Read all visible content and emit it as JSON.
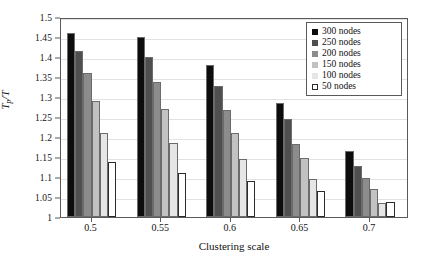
{
  "chart_data": {
    "type": "bar",
    "title": "",
    "subtitle": "",
    "xlabel": "Clustering scale",
    "ylabel": "Tp/T",
    "ylabel_parts": {
      "main": "T",
      "sub": "p",
      "tail": "/T"
    },
    "categories": [
      "0.5",
      "0.55",
      "0.6",
      "0.65",
      "0.7"
    ],
    "ylim": [
      1,
      1.5
    ],
    "ytick_labels": [
      "1",
      "1.05",
      "1.1",
      "1.15",
      "1.2",
      "1.25",
      "1.3",
      "1.35",
      "1.4",
      "1.45",
      "1.5"
    ],
    "ytick_values": [
      1,
      1.05,
      1.1,
      1.15,
      1.2,
      1.25,
      1.3,
      1.35,
      1.4,
      1.45,
      1.5
    ],
    "grid": true,
    "grid_axis": "y",
    "legend_position": "top-right",
    "series": [
      {
        "name": "300 nodes",
        "color": "#0d0d0d",
        "values": [
          1.46,
          1.45,
          1.381,
          1.285,
          1.165
        ]
      },
      {
        "name": "250 nodes",
        "color": "#4f4f4f",
        "values": [
          1.416,
          1.399,
          1.327,
          1.245,
          1.127
        ]
      },
      {
        "name": "200 nodes",
        "color": "#8c8c8c",
        "values": [
          1.361,
          1.338,
          1.268,
          1.183,
          1.097
        ]
      },
      {
        "name": "150 nodes",
        "color": "#c2c2c2",
        "values": [
          1.291,
          1.271,
          1.211,
          1.147,
          1.07
        ]
      },
      {
        "name": "100 nodes",
        "color": "#e6e6e6",
        "values": [
          1.21,
          1.185,
          1.145,
          1.095,
          1.035
        ]
      },
      {
        "name": "50 nodes",
        "color": "#ffffff",
        "values": [
          1.137,
          1.11,
          1.09,
          1.066,
          1.038
        ]
      }
    ]
  },
  "legend": {
    "entries": [
      {
        "label": "300 nodes"
      },
      {
        "label": "250 nodes"
      },
      {
        "label": "200 nodes"
      },
      {
        "label": "150 nodes"
      },
      {
        "label": "100 nodes"
      },
      {
        "label": "50 nodes"
      }
    ]
  },
  "axes": {
    "x_title": "Clustering scale",
    "y_title": "Tp/T"
  }
}
